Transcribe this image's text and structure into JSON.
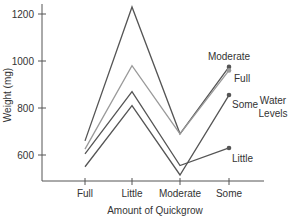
{
  "chart_data": {
    "type": "line",
    "title": "",
    "xlabel": "Amount of Quickgrow",
    "ylabel": "Weight (mg)",
    "categories": [
      "Full",
      "Little",
      "Moderate",
      "Some"
    ],
    "yticks": [
      600,
      800,
      1000,
      1200
    ],
    "ylim": [
      490,
      1250
    ],
    "grid": false,
    "legend_title": "Water Levels",
    "legend_title_lines": [
      "Water",
      "Levels"
    ],
    "legend_position": "right, labels at line ends",
    "series": [
      {
        "name": "Moderate",
        "values": [
          660,
          1230,
          690,
          975
        ],
        "color": "#555555"
      },
      {
        "name": "Full",
        "values": [
          625,
          980,
          690,
          960
        ],
        "color": "#9a9a9a"
      },
      {
        "name": "Little",
        "values": [
          605,
          870,
          555,
          630
        ],
        "color": "#555555"
      },
      {
        "name": "Some",
        "values": [
          550,
          810,
          515,
          855
        ],
        "color": "#555555"
      }
    ]
  }
}
